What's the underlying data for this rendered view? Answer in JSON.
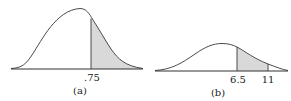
{
  "panels": [
    {
      "id": "a",
      "caption": "(a)",
      "tick_labels": [
        ".75"
      ],
      "shaded_region": "right tail beyond .75"
    },
    {
      "id": "b",
      "caption": "(b)",
      "tick_labels": [
        "6.5",
        "11"
      ],
      "shaded_region": "between 6.5 and 11"
    }
  ],
  "colors": {
    "curve": "#4a4a4a",
    "shade": "#d9d9d9",
    "axis": "#333333"
  }
}
